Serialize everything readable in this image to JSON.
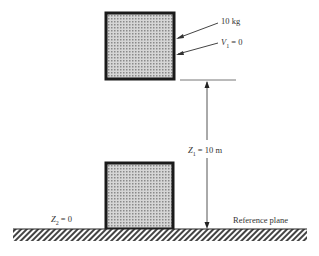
{
  "diagram": {
    "top_mass": {
      "label": "10 kg",
      "velocity_var": "V",
      "velocity_sub": "1",
      "velocity_val": " = 0"
    },
    "height": {
      "var": "Z",
      "sub": "1",
      "val": " = 10 m"
    },
    "ground": {
      "var": "Z",
      "sub": "2",
      "val": " = 0",
      "reference_label": "Reference plane"
    },
    "colors": {
      "box_fill": "#bdbdbd",
      "box_border": "#1a1a1a",
      "line": "#555555"
    }
  }
}
